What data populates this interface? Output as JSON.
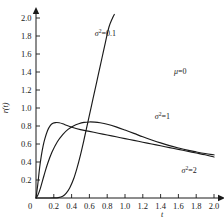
{
  "chart_data": {
    "type": "line",
    "title": "",
    "xlabel": "t",
    "ylabel": "r(t)",
    "xlim": [
      0,
      2.0
    ],
    "ylim": [
      0,
      2.0
    ],
    "grid": false,
    "legend_position": "inline-annotations",
    "xticks": [
      "0",
      "0.2",
      "0.4",
      "0.6",
      "0.8",
      "1.0",
      "1.2",
      "1.4",
      "1.6",
      "1.8",
      "2.0"
    ],
    "xtick_values": [
      0,
      0.2,
      0.4,
      0.6,
      0.8,
      1.0,
      1.2,
      1.4,
      1.6,
      1.8,
      2.0
    ],
    "yticks": [
      "0.2",
      "0.4",
      "0.6",
      "0.8",
      "1.0",
      "1.2",
      "1.4",
      "1.6",
      "1.8",
      "2.0"
    ],
    "ytick_values": [
      0.2,
      0.4,
      0.6,
      0.8,
      1.0,
      1.2,
      1.4,
      1.6,
      1.8,
      2.0
    ],
    "origin_label": "0",
    "annotations": [
      {
        "name": "mu-annotation",
        "text": "μ=0",
        "symbol": "μ",
        "rest": "=0",
        "x": 1.62,
        "y": 1.38
      },
      {
        "name": "sigma-0p1-annotation",
        "text": "σ²=0.1",
        "symbol": "σ",
        "sup": "2",
        "rest": "=0.1",
        "x": 0.78,
        "y": 1.8
      },
      {
        "name": "sigma-1-annotation",
        "text": "σ²=1",
        "symbol": "σ",
        "sup": "2",
        "rest": "=1",
        "x": 1.42,
        "y": 0.88
      },
      {
        "name": "sigma-2-annotation",
        "text": "σ²=2",
        "symbol": "σ",
        "sup": "2",
        "rest": "=2",
        "x": 1.72,
        "y": 0.28
      }
    ],
    "series": [
      {
        "name": "σ²=0.1",
        "sigma_squared": 0.1,
        "mu": 0,
        "x": [
          0.0,
          0.02,
          0.05,
          0.1,
          0.15,
          0.2,
          0.25,
          0.3,
          0.34,
          0.38,
          0.42,
          0.46,
          0.5,
          0.54,
          0.58,
          0.62,
          0.66,
          0.7,
          0.74,
          0.78,
          0.82,
          0.86,
          0.88
        ],
        "y": [
          0.0,
          0.0,
          0.0,
          0.0,
          0.0,
          0.001,
          0.004,
          0.02,
          0.055,
          0.115,
          0.205,
          0.33,
          0.48,
          0.65,
          0.83,
          1.01,
          1.19,
          1.37,
          1.55,
          1.73,
          1.9,
          2.0,
          2.04
        ]
      },
      {
        "name": "σ²=1",
        "sigma_squared": 1,
        "mu": 0,
        "x": [
          0.0,
          0.02,
          0.04,
          0.06,
          0.08,
          0.1,
          0.13,
          0.16,
          0.19,
          0.22,
          0.26,
          0.3,
          0.35,
          0.4,
          0.5,
          0.6,
          0.7,
          0.8,
          0.9,
          1.0,
          1.1,
          1.2,
          1.3,
          1.4,
          1.5,
          1.6,
          1.7,
          1.8,
          1.9,
          2.0
        ],
        "y": [
          0.0,
          0.15,
          0.33,
          0.47,
          0.58,
          0.66,
          0.75,
          0.805,
          0.83,
          0.838,
          0.836,
          0.825,
          0.805,
          0.788,
          0.76,
          0.74,
          0.72,
          0.7,
          0.68,
          0.66,
          0.64,
          0.62,
          0.6,
          0.58,
          0.56,
          0.54,
          0.52,
          0.5,
          0.48,
          0.455
        ]
      },
      {
        "name": "σ²=2",
        "sigma_squared": 2,
        "mu": 0,
        "x": [
          0.0,
          0.02,
          0.05,
          0.09,
          0.13,
          0.18,
          0.24,
          0.3,
          0.36,
          0.42,
          0.48,
          0.54,
          0.6,
          0.66,
          0.72,
          0.8,
          0.9,
          1.0,
          1.1,
          1.2,
          1.3,
          1.4,
          1.5,
          1.6,
          1.7,
          1.8,
          1.9,
          2.0
        ],
        "y": [
          0.0,
          0.03,
          0.11,
          0.25,
          0.38,
          0.51,
          0.625,
          0.705,
          0.762,
          0.8,
          0.825,
          0.84,
          0.845,
          0.843,
          0.836,
          0.82,
          0.79,
          0.755,
          0.718,
          0.68,
          0.645,
          0.612,
          0.582,
          0.556,
          0.532,
          0.512,
          0.494,
          0.48
        ]
      }
    ]
  }
}
